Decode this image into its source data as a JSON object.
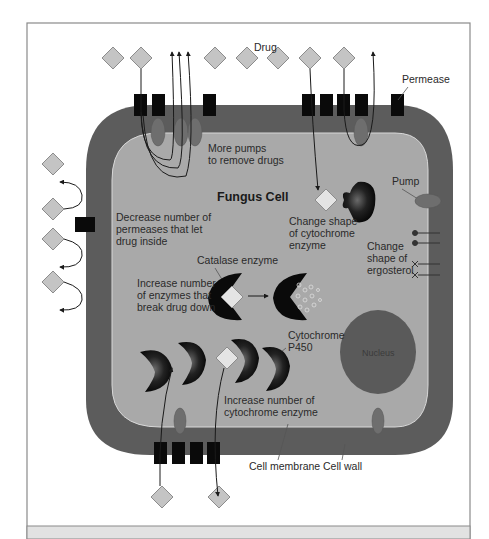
{
  "figure": {
    "title": "Fungus Cell",
    "colors": {
      "background": "#ffffff",
      "frame": "#8a8a8a",
      "footer_band": "#e2e2e2",
      "cell_wall": "#5c5c5c",
      "cytoplasm": "#a9a9a9",
      "membrane_edge": "#d8d8d8",
      "drug": "#c4c4c4",
      "drug_inside": "#e4e4e4",
      "permease": "#0a0a0a",
      "pump": "#6e6e6e",
      "nucleus": "#5a5a5a",
      "enzyme": "#111111"
    }
  },
  "labels": {
    "drug": "Drug",
    "permease": "Permease",
    "more_pumps_1": "More pumps",
    "more_pumps_2": "to remove drugs",
    "fungus_cell": "Fungus Cell",
    "pump": "Pump",
    "decrease_1": "Decrease number of",
    "decrease_2": "permeases that let",
    "decrease_3": "drug inside",
    "change_cyt_1": "Change shape",
    "change_cyt_2": "of cytochrome",
    "change_cyt_3": "enzyme",
    "change_erg_1": "Change",
    "change_erg_2": "shape of",
    "change_erg_3": "ergosterol",
    "catalase": "Catalase enzyme",
    "increase_enz_1": "Increase number",
    "increase_enz_2": "of enzymes that",
    "increase_enz_3": "break drug down",
    "cytochrome_1": "Cytochrome",
    "cytochrome_2": "P450",
    "nucleus": "Nucleus",
    "increase_cyt_1": "Increase number of",
    "increase_cyt_2": "cytochrome enzyme",
    "cell_membrane": "Cell membrane",
    "cell_wall": "Cell wall"
  },
  "mechanisms": [
    "More pumps to remove drugs",
    "Decrease number of permeases that let drug inside",
    "Change shape of cytochrome enzyme",
    "Change shape of ergosterol",
    "Increase number of enzymes that break drug down",
    "Increase number of cytochrome enzyme"
  ]
}
